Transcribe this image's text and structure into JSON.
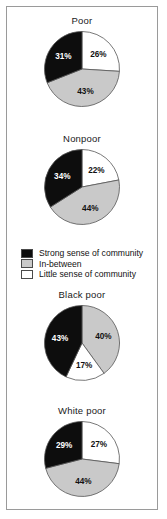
{
  "figure": {
    "background": "#ffffff",
    "frame_color": "#9a9a9a"
  },
  "colors": {
    "strong": "#0d0d0d",
    "inbetween": "#c9c9c9",
    "little": "#ffffff",
    "outline": "#555555",
    "text": "#111111"
  },
  "legend": {
    "name": "chart-legend",
    "items": [
      {
        "swatch": "strong",
        "label": "Strong sense of community"
      },
      {
        "swatch": "inbetween",
        "label": "In-between"
      },
      {
        "swatch": "little",
        "label": "Little sense of community"
      }
    ]
  },
  "chart_data": [
    {
      "type": "pie",
      "title": "Poor",
      "labels": [
        "Little sense of community",
        "In-between",
        "Strong sense of community"
      ],
      "values": [
        26,
        43,
        31
      ],
      "display_labels": [
        "26%",
        "43%",
        "31%"
      ],
      "colors": [
        "#ffffff",
        "#c9c9c9",
        "#0d0d0d"
      ],
      "start_angle": 0,
      "direction": "clockwise",
      "units": "percent"
    },
    {
      "type": "pie",
      "title": "Nonpoor",
      "labels": [
        "Little sense of community",
        "In-between",
        "Strong sense of community"
      ],
      "values": [
        22,
        44,
        34
      ],
      "display_labels": [
        "22%",
        "44%",
        "34%"
      ],
      "colors": [
        "#ffffff",
        "#c9c9c9",
        "#0d0d0d"
      ],
      "start_angle": 0,
      "direction": "clockwise",
      "units": "percent"
    },
    {
      "type": "pie",
      "title": "Black poor",
      "labels": [
        "In-between",
        "Little sense of community",
        "Strong sense of community"
      ],
      "values": [
        40,
        17,
        43
      ],
      "display_labels": [
        "40%",
        "17%",
        "43%"
      ],
      "colors": [
        "#c9c9c9",
        "#ffffff",
        "#0d0d0d"
      ],
      "start_angle": 0,
      "direction": "clockwise",
      "units": "percent"
    },
    {
      "type": "pie",
      "title": "White poor",
      "labels": [
        "Little sense of community",
        "In-between",
        "Strong sense of community"
      ],
      "values": [
        27,
        44,
        29
      ],
      "display_labels": [
        "27%",
        "44%",
        "29%"
      ],
      "colors": [
        "#ffffff",
        "#c9c9c9",
        "#0d0d0d"
      ],
      "start_angle": 0,
      "direction": "clockwise",
      "units": "percent"
    }
  ],
  "panels": [
    {
      "top": 8,
      "chart_index": 0
    },
    {
      "top": 126,
      "chart_index": 1
    },
    {
      "top": 282,
      "chart_index": 2
    },
    {
      "top": 398,
      "chart_index": 3
    }
  ]
}
